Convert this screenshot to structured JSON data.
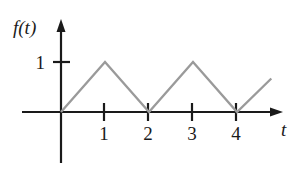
{
  "figure": {
    "background_color": "#ffffff",
    "width": 299,
    "height": 173
  },
  "labels": {
    "y_axis": "f(t)",
    "x_axis": "t",
    "y_tick_1": "1",
    "x_tick_1": "1",
    "x_tick_2": "2",
    "x_tick_3": "3",
    "x_tick_4": "4"
  },
  "colors": {
    "axis": "#1a1a1a",
    "curve": "#9a9a9a",
    "text": "#1a1a1a",
    "background": "#ffffff"
  },
  "chart_data": {
    "type": "line",
    "title": "",
    "xlabel": "t",
    "ylabel": "f(t)",
    "xlim": [
      0,
      5
    ],
    "ylim": [
      0,
      1.25
    ],
    "grid": false,
    "legend": null,
    "xticks": [
      1,
      2,
      3,
      4
    ],
    "xtick_labels": [
      "1",
      "2",
      "3",
      "4"
    ],
    "yticks": [
      1
    ],
    "ytick_labels": [
      "1"
    ],
    "series": [
      {
        "name": "f(t)",
        "color": "#9a9a9a",
        "x": [
          0,
          1,
          2,
          3,
          4,
          4.78
        ],
        "y": [
          0,
          1,
          0,
          1,
          0,
          0.67
        ]
      }
    ]
  }
}
